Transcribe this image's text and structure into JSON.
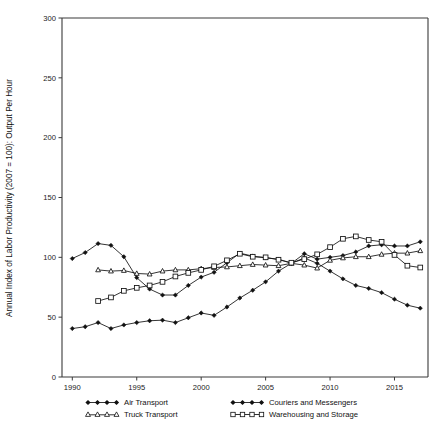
{
  "chart_data": {
    "type": "line",
    "title": "",
    "subtitle": "",
    "xlabel": "",
    "ylabel": "Annual Index of Labor Productivity (2007 = 100): Output Per Hour",
    "xlim": [
      1989.2,
      1917.0
    ],
    "x_axis_range": [
      1989.2,
      2017.6
    ],
    "ylim": [
      0,
      300
    ],
    "y_ticks": [
      0,
      50,
      100,
      150,
      200,
      250,
      300
    ],
    "y_tick_labels": [
      "0",
      "50",
      "100",
      "150",
      "200",
      "250",
      "300"
    ],
    "x_ticks": [
      1990,
      1995,
      2000,
      2005,
      2010,
      2015
    ],
    "x_tick_labels": [
      "1990",
      "1995",
      "2000",
      "2005",
      "2010",
      "2015"
    ],
    "grid": false,
    "legend_position": "below-plot",
    "x": [
      1990,
      1991,
      1992,
      1993,
      1994,
      1995,
      1996,
      1997,
      1998,
      1999,
      2000,
      2001,
      2002,
      2003,
      2004,
      2005,
      2006,
      2007,
      2008,
      2009,
      2010,
      2011,
      2012,
      2013,
      2014,
      2015,
      2016,
      2017
    ],
    "series": [
      {
        "name": "Air Transport",
        "marker": "filled-diamond",
        "color": "#111111",
        "values": [
          40.5,
          42.0,
          45.5,
          40.5,
          43.5,
          45.5,
          47.0,
          47.5,
          45.5,
          49.5,
          53.5,
          51.5,
          58.5,
          66.0,
          72.5,
          79.5,
          88.5,
          95.0,
          99.5,
          95.0,
          88.5,
          82.0,
          76.5,
          74.0,
          70.5,
          65.0,
          60.0,
          57.5
        ]
      },
      {
        "name": "Couriers and Messengers",
        "marker": "filled-diamond",
        "color": "#111111",
        "values": [
          99.0,
          104.0,
          111.5,
          110.0,
          100.5,
          83.0,
          73.5,
          68.5,
          68.5,
          76.5,
          83.5,
          87.5,
          95.5,
          103.5,
          101.0,
          99.5,
          98.5,
          95.0,
          103.0,
          98.5,
          100.0,
          101.5,
          104.5,
          109.5,
          110.5,
          109.5,
          109.5,
          113.0
        ]
      },
      {
        "name": "Truck Transport",
        "marker": "open-triangle",
        "color": "#111111",
        "values": [
          null,
          null,
          89.5,
          88.5,
          89.0,
          86.5,
          86.0,
          88.5,
          89.5,
          89.5,
          90.5,
          91.5,
          92.0,
          93.0,
          94.0,
          93.5,
          93.0,
          95.0,
          93.5,
          91.0,
          97.5,
          99.5,
          100.5,
          100.5,
          102.5,
          103.5,
          103.5,
          105.5
        ]
      },
      {
        "name": "Warehousing and Storage",
        "marker": "open-square",
        "color": "#111111",
        "values": [
          null,
          null,
          63.5,
          66.5,
          72.0,
          74.5,
          76.5,
          79.5,
          84.0,
          87.0,
          89.5,
          92.5,
          97.5,
          103.0,
          100.5,
          100.0,
          98.0,
          95.5,
          98.5,
          102.5,
          108.5,
          115.5,
          117.5,
          114.5,
          113.0,
          102.0,
          93.0,
          91.5
        ]
      }
    ]
  },
  "legend": {
    "entries": [
      {
        "label": "Air Transport",
        "marker": "filled-diamond"
      },
      {
        "label": "Couriers and Messengers",
        "marker": "filled-diamond"
      },
      {
        "label": "Truck Transport",
        "marker": "open-triangle"
      },
      {
        "label": "Warehousing and Storage",
        "marker": "open-square"
      }
    ]
  },
  "colors": {
    "series": "#111111",
    "axis": "#3a3a3a",
    "background": "#ffffff"
  }
}
